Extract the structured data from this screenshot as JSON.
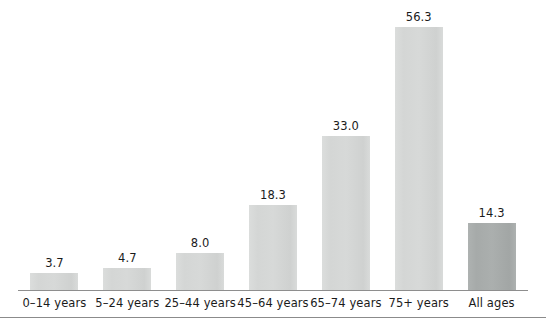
{
  "chart_data": {
    "type": "bar",
    "title": "",
    "subtitle": "",
    "xlabel": "",
    "ylabel": "",
    "categories": [
      "0–14 years",
      "5–24 years",
      "25–44 years",
      "45–64 years",
      "65–74 years",
      "75+ years",
      "All ages"
    ],
    "values": [
      3.7,
      4.7,
      8.0,
      18.3,
      33.0,
      56.3,
      14.3
    ],
    "value_labels": [
      "3.7",
      "4.7",
      "8.0",
      "18.3",
      "33.0",
      "56.3",
      "14.3"
    ],
    "ylim": [
      0,
      56.3
    ],
    "grid": false,
    "legend": null,
    "axis": {
      "x_axis_line": true,
      "y_axis_line": false,
      "tick_marks": false
    },
    "series": [
      {
        "name": "",
        "values": [
          3.7,
          4.7,
          8.0,
          18.3,
          33.0,
          56.3,
          14.3
        ]
      }
    ],
    "bar_styles": [
      "standard",
      "standard",
      "standard",
      "standard",
      "standard",
      "standard",
      "accent"
    ],
    "colors": {
      "bar_standard": "#d6d8d7",
      "bar_accent": "#a9adac",
      "axis_line": "#8e8e8e",
      "rule_line": "#8b8b8b",
      "text": "#1b1b1b",
      "background": "#ffffff"
    }
  }
}
